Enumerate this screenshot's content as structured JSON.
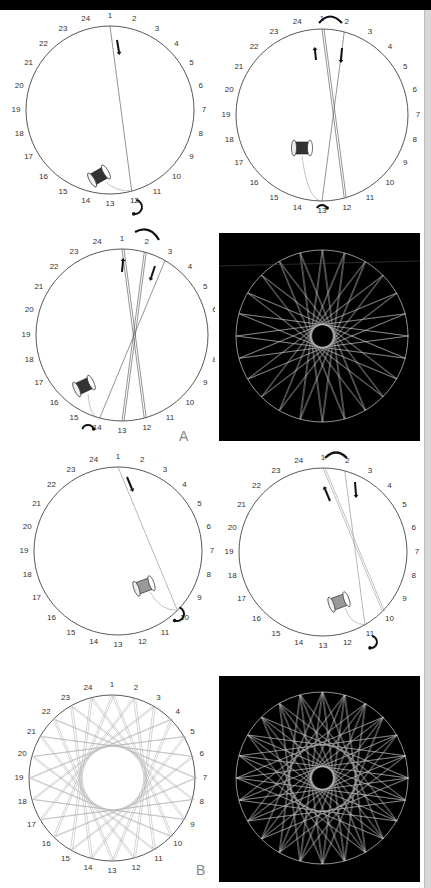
{
  "figure": {
    "pin_count": 24,
    "pin_labels": [
      "1",
      "2",
      "3",
      "4",
      "5",
      "6",
      "7",
      "8",
      "9",
      "10",
      "11",
      "12",
      "13",
      "14",
      "15",
      "16",
      "17",
      "18",
      "19",
      "20",
      "21",
      "22",
      "23",
      "24"
    ],
    "section_labels": {
      "a": "A",
      "b": "B"
    },
    "colors": {
      "background": "#ffffff",
      "circle_stroke": "#444444",
      "thread": "#666666",
      "photo_bg": "#000000",
      "photo_thread": "#cfcfcf",
      "arrow": "#111111"
    }
  },
  "panels": [
    {
      "id": "a-step1",
      "section": "A",
      "threads": [
        [
          1,
          12
        ]
      ],
      "spool_near_pin": 12,
      "arrows": [
        "down-near-1"
      ],
      "turn_arrow_pin": 12
    },
    {
      "id": "a-step2",
      "section": "A",
      "threads": [
        [
          1,
          12
        ],
        [
          12,
          13
        ]
      ],
      "spool_near_pin": 13,
      "arrows": [
        "up-near-1",
        "down-near-2"
      ],
      "turn_arrow_pins": [
        1,
        2,
        13
      ]
    },
    {
      "id": "a-step3",
      "section": "A",
      "threads": [
        [
          1,
          12
        ],
        [
          2,
          13
        ],
        [
          3,
          14
        ]
      ],
      "spool_near_pin": 14,
      "arrows": [
        "up-near-2",
        "down-near-3"
      ],
      "turn_arrow_pins": [
        2,
        3,
        14
      ]
    },
    {
      "id": "a-photo",
      "section": "A",
      "type": "photo",
      "pattern": "24-pin star, skip 11"
    },
    {
      "id": "b-step1",
      "section": "B",
      "threads": [
        [
          1,
          10
        ]
      ],
      "spool_near_pin": 10,
      "arrows": [
        "down-near-1"
      ],
      "turn_arrow_pin": 10
    },
    {
      "id": "b-step2",
      "section": "B",
      "threads": [
        [
          1,
          10
        ],
        [
          2,
          11
        ]
      ],
      "spool_near_pin": 11,
      "arrows": [
        "up-near-1",
        "down-near-2"
      ],
      "turn_arrow_pins": [
        1,
        2,
        11
      ]
    },
    {
      "id": "b-complete",
      "section": "B",
      "type": "completed-diagram",
      "skip": 9
    },
    {
      "id": "b-photo",
      "section": "B",
      "type": "photo",
      "pattern": "24-pin star, skip 9 + skip 11"
    }
  ]
}
